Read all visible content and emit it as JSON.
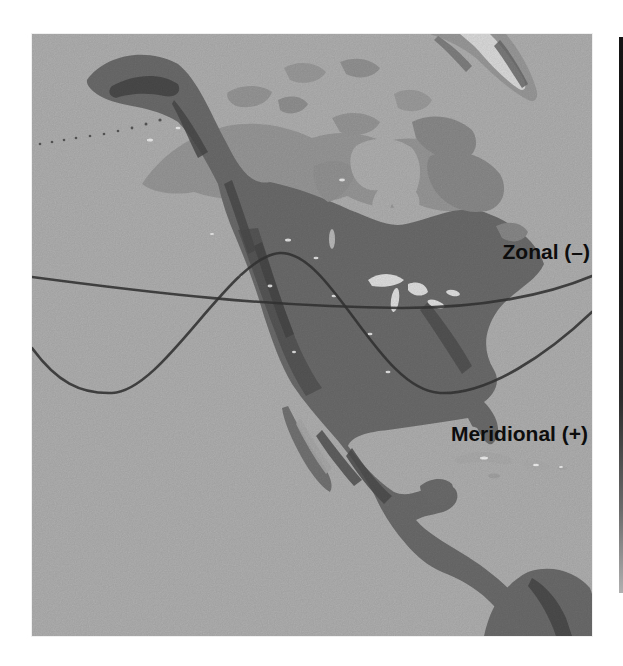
{
  "figure": {
    "kind": "annotated relief map",
    "region": "North America",
    "style": "grayscale shaded-relief halftone scan"
  },
  "annotations": {
    "zonal": {
      "label": "Zonal (–)"
    },
    "meridional": {
      "label": "Meridional (+)"
    }
  },
  "curves": {
    "zonal_path": "M 0 243 C 120 259, 240 273, 370 274 C 450 274, 515 261, 560 242",
    "meridional_path": "M 0 314 C 25 348, 48 360, 80 359 C 132 357, 198 222, 248 219 C 300 217, 346 356, 408 359 C 456 361, 516 320, 560 278"
  },
  "colors": {
    "page": "#ffffff",
    "ocean": "#b6b6b6",
    "tundra": "#9d9d9d",
    "land_dark": "#6f6f6f",
    "mountains": "#525252",
    "lakes": "#e8e8e8",
    "curve": "#353535",
    "label_text": "#0d0d0d",
    "adjacent_edge": "#141414"
  }
}
